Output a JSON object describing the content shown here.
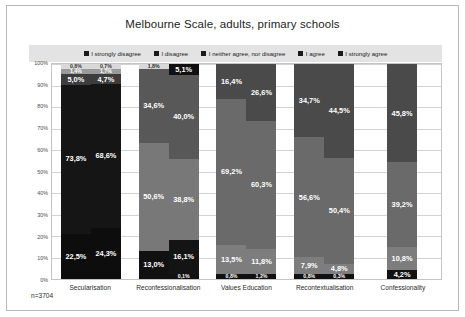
{
  "chart_data": {
    "type": "bar",
    "subtype": "stacked-100-percent",
    "title": "Melbourne Scale, adults, primary schools",
    "xlabel": "",
    "ylabel": "",
    "ylim": [
      0,
      100
    ],
    "ytick_labels": [
      "0%",
      "10%",
      "20%",
      "30%",
      "40%",
      "50%",
      "60%",
      "70%",
      "80%",
      "90%",
      "100%"
    ],
    "ytick_values": [
      0,
      10,
      20,
      30,
      40,
      50,
      60,
      70,
      80,
      90,
      100
    ],
    "grid": true,
    "legend_position": "top",
    "sample_note": "n=3704",
    "categories": [
      "Secularisation",
      "Reconfessionalisation",
      "Values Education",
      "Recontextualisation",
      "Confessionality"
    ],
    "series": [
      {
        "name": "I strongly disagree",
        "color": "#0d0d0d"
      },
      {
        "name": "I disagree",
        "color": "#2b2b2b"
      },
      {
        "name": "I neither agree, nor disagree",
        "color": "#6f6f6f"
      },
      {
        "name": "I agree",
        "color": "#4f4f4f"
      },
      {
        "name": "I strongly agree",
        "color": "#d9d9d9"
      }
    ],
    "bars": [
      {
        "group": "Secularisation",
        "index": 0,
        "segments": [
          {
            "series": "I strongly disagree",
            "value": 22.5,
            "label": "22,5%",
            "color": "#0d0d0d",
            "label_color": "#ffffff"
          },
          {
            "series": "I disagree",
            "value": 73.8,
            "label": "73,8%",
            "color": "#151515",
            "label_color": "#ffffff"
          },
          {
            "series": "I neither agree, nor disagree",
            "value": 5.0,
            "label": "5,0%",
            "color": "#3d3d3d",
            "label_color": "#ffffff"
          },
          {
            "series": "I agree",
            "value": 1.4,
            "label": "1,4%",
            "color": "#9a9a9a",
            "label_color": "#ffffff"
          },
          {
            "series": "I strongly agree",
            "value": 0.8,
            "label": "0,8%",
            "color": "#d9d9d9",
            "label_color": "#3a3a3a"
          }
        ]
      },
      {
        "group": "Secularisation",
        "index": 1,
        "segments": [
          {
            "series": "I strongly disagree",
            "value": 24.3,
            "label": "24,3%",
            "color": "#0d0d0d",
            "label_color": "#ffffff"
          },
          {
            "series": "I disagree",
            "value": 68.6,
            "label": "68,6%",
            "color": "#151515",
            "label_color": "#ffffff"
          },
          {
            "series": "I neither agree, nor disagree",
            "value": 4.7,
            "label": "4,7%",
            "color": "#3d3d3d",
            "label_color": "#ffffff"
          },
          {
            "series": "I agree",
            "value": 1.7,
            "label": "1,7%",
            "color": "#9a9a9a",
            "label_color": "#ffffff"
          },
          {
            "series": "I strongly agree",
            "value": 0.7,
            "label": "0,7%",
            "color": "#d9d9d9",
            "label_color": "#3a3a3a"
          }
        ]
      },
      {
        "group": "Reconfessionalisation",
        "index": 0,
        "segments": [
          {
            "series": "I strongly disagree",
            "value": 13.0,
            "label": "13,0%",
            "color": "#111111",
            "label_color": "#ffffff"
          },
          {
            "series": "I disagree",
            "value": 50.6,
            "label": "50,6%",
            "color": "#787878",
            "label_color": "#ffffff"
          },
          {
            "series": "I neither agree, nor disagree",
            "value": 34.6,
            "label": "34,6%",
            "color": "#585858",
            "label_color": "#ffffff"
          },
          {
            "series": "I agree",
            "value": 1.8,
            "label": "1,8%",
            "color": "#d9d9d9",
            "label_color": "#2a2a2a"
          }
        ]
      },
      {
        "group": "Reconfessionalisation",
        "index": 1,
        "segments": [
          {
            "series": "I strongly disagree",
            "value": 0.1,
            "label": "0,1%",
            "color": "#111111",
            "label_color": "#ffffff"
          },
          {
            "series": "I disagree",
            "value": 16.1,
            "label": "16,1%",
            "color": "#141414",
            "label_color": "#ffffff"
          },
          {
            "series": "I neither agree, nor disagree",
            "value": 38.8,
            "label": "38,8%",
            "color": "#787878",
            "label_color": "#ffffff"
          },
          {
            "series": "I agree",
            "value": 40.0,
            "label": "40,0%",
            "color": "#585858",
            "label_color": "#ffffff"
          },
          {
            "series": "I strongly agree",
            "value": 5.1,
            "label": "5,1%",
            "color": "#111111",
            "label_color": "#ffffff"
          }
        ]
      },
      {
        "group": "Values Education",
        "index": 0,
        "segments": [
          {
            "series": "I strongly disagree",
            "value": 0.8,
            "label": "0,8%",
            "color": "#111111",
            "label_color": "#ffffff"
          },
          {
            "series": "I disagree",
            "value": 13.5,
            "label": "13,5%",
            "color": "#7d7d7d",
            "label_color": "#ffffff"
          },
          {
            "series": "I neither agree, nor disagree",
            "value": 69.2,
            "label": "69,2%",
            "color": "#6a6a6a",
            "label_color": "#ffffff"
          },
          {
            "series": "I agree",
            "value": 16.4,
            "label": "16,4%",
            "color": "#4a4a4a",
            "label_color": "#ffffff"
          }
        ]
      },
      {
        "group": "Values Education",
        "index": 1,
        "segments": [
          {
            "series": "I strongly disagree",
            "value": 1.2,
            "label": "1,2%",
            "color": "#111111",
            "label_color": "#ffffff"
          },
          {
            "series": "I disagree",
            "value": 11.8,
            "label": "11,8%",
            "color": "#7d7d7d",
            "label_color": "#ffffff"
          },
          {
            "series": "I neither agree, nor disagree",
            "value": 60.3,
            "label": "60,3%",
            "color": "#6a6a6a",
            "label_color": "#ffffff"
          },
          {
            "series": "I agree",
            "value": 26.6,
            "label": "26,6%",
            "color": "#4a4a4a",
            "label_color": "#ffffff"
          }
        ]
      },
      {
        "group": "Recontextualisation",
        "index": 0,
        "segments": [
          {
            "series": "I strongly disagree",
            "value": 0.8,
            "label": "0,8%",
            "color": "#111111",
            "label_color": "#ffffff"
          },
          {
            "series": "I disagree",
            "value": 7.9,
            "label": "7,9%",
            "color": "#7d7d7d",
            "label_color": "#ffffff"
          },
          {
            "series": "I neither agree, nor disagree",
            "value": 56.6,
            "label": "56,6%",
            "color": "#6a6a6a",
            "label_color": "#ffffff"
          },
          {
            "series": "I agree",
            "value": 34.7,
            "label": "34,7%",
            "color": "#4a4a4a",
            "label_color": "#ffffff"
          }
        ]
      },
      {
        "group": "Recontextualisation",
        "index": 1,
        "segments": [
          {
            "series": "I strongly disagree",
            "value": 0.3,
            "label": "0,3%",
            "color": "#111111",
            "label_color": "#ffffff"
          },
          {
            "series": "I disagree",
            "value": 4.8,
            "label": "4,8%",
            "color": "#7d7d7d",
            "label_color": "#ffffff"
          },
          {
            "series": "I neither agree, nor disagree",
            "value": 50.4,
            "label": "50,4%",
            "color": "#6a6a6a",
            "label_color": "#ffffff"
          },
          {
            "series": "I agree",
            "value": 44.5,
            "label": "44,5%",
            "color": "#4a4a4a",
            "label_color": "#ffffff"
          }
        ]
      },
      {
        "group": "Confessionality",
        "index": 0,
        "segments": [
          {
            "series": "I strongly disagree",
            "value": 4.2,
            "label": "4,2%",
            "color": "#111111",
            "label_color": "#ffffff"
          },
          {
            "series": "I disagree",
            "value": 10.8,
            "label": "10,8%",
            "color": "#7d7d7d",
            "label_color": "#ffffff"
          },
          {
            "series": "I neither agree, nor disagree",
            "value": 39.2,
            "label": "39,2%",
            "color": "#6a6a6a",
            "label_color": "#ffffff"
          },
          {
            "series": "I agree",
            "value": 45.8,
            "label": "45,8%",
            "color": "#4a4a4a",
            "label_color": "#ffffff"
          }
        ]
      }
    ]
  }
}
